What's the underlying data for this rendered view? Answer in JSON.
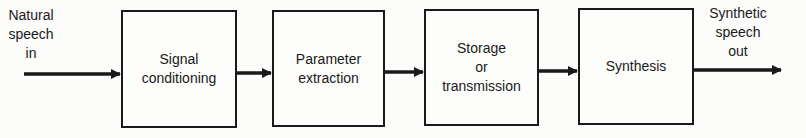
{
  "diagram": {
    "input_label": "Natural\nspeech\nin",
    "output_label": "Synthetic\nspeech\nout",
    "blocks": [
      {
        "label": "Signal\nconditioning"
      },
      {
        "label": "Parameter\nextraction"
      },
      {
        "label": "Storage\nor\ntransmission"
      },
      {
        "label": "Synthesis"
      }
    ],
    "colors": {
      "stroke": "#1a1a1a",
      "background": "#fcfcfa"
    }
  }
}
